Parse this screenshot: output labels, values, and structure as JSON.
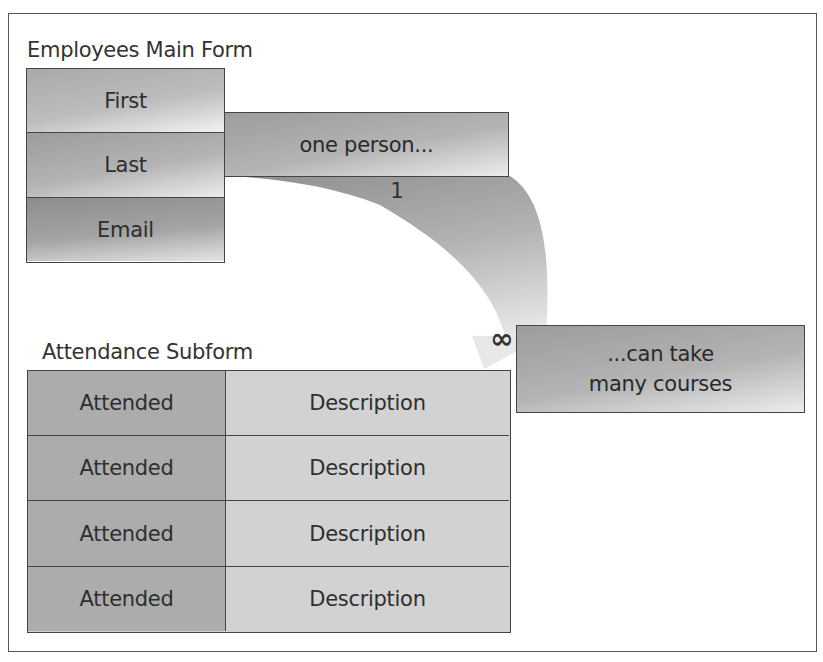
{
  "diagram": {
    "type": "one-to-many relationship illustration",
    "main_form": {
      "title": "Employees Main Form",
      "fields": [
        {
          "label": "First"
        },
        {
          "label": "Last"
        },
        {
          "label": "Email"
        }
      ]
    },
    "connector": {
      "callout_one": "one person...",
      "one_side_symbol": "1",
      "many_side_symbol": "∞",
      "callout_many_line1": "...can take",
      "callout_many_line2": "many courses"
    },
    "subform": {
      "title": "Attendance Subform",
      "rows": [
        {
          "attended": "Attended",
          "description": "Description"
        },
        {
          "attended": "Attended",
          "description": "Description"
        },
        {
          "attended": "Attended",
          "description": "Description"
        },
        {
          "attended": "Attended",
          "description": "Description"
        }
      ]
    },
    "colors": {
      "frame_border": "#555555",
      "box_border": "#444444",
      "attended_fill": "#acacac",
      "description_fill": "#d2d2d2",
      "arrow_dark": "#9a9a9a",
      "arrow_light": "#e6e6e6"
    }
  }
}
